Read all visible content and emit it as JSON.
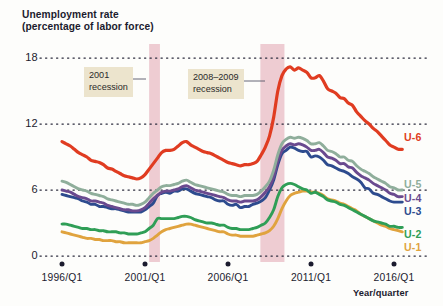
{
  "chart_data": {
    "type": "line",
    "title": "Unemployment rate",
    "subtitle": "(percentage of labor force)",
    "xlabel": "Year/quarter",
    "ylabel": "",
    "ylim": [
      0,
      19.2
    ],
    "xlim": [
      1996,
      2016.75
    ],
    "grid": "horizontal-dotted",
    "legend_position": "right-inline",
    "yticks": [
      "0",
      "6",
      "12",
      "18"
    ],
    "ytick_values": [
      0,
      6,
      12,
      18
    ],
    "xticks": [
      "1996/Q1",
      "2001/Q1",
      "2006/Q1",
      "2011/Q1",
      "2016/Q1"
    ],
    "xtick_values": [
      1996,
      2001,
      2006,
      2011,
      2016
    ],
    "annotations": [
      {
        "name": "recession-2001",
        "label_line1": "2001",
        "label_line2": "recession",
        "band_start": 2001.25,
        "band_end": 2001.9
      },
      {
        "name": "recession-2008-2009",
        "label_line1": "2008–2009",
        "label_line2": "recession",
        "band_start": 2007.95,
        "band_end": 2009.4
      }
    ],
    "band_color": "#e7b8c2",
    "series": [
      {
        "name": "U-6",
        "label": "U-6",
        "color": "#e03c21",
        "x": [
          1996.0,
          1996.25,
          1996.5,
          1996.75,
          1997.0,
          1997.25,
          1997.5,
          1997.75,
          1998.0,
          1998.25,
          1998.5,
          1998.75,
          1999.0,
          1999.25,
          1999.5,
          1999.75,
          2000.0,
          2000.25,
          2000.5,
          2000.75,
          2001.0,
          2001.25,
          2001.5,
          2001.75,
          2002.0,
          2002.25,
          2002.5,
          2002.75,
          2003.0,
          2003.25,
          2003.5,
          2003.75,
          2004.0,
          2004.25,
          2004.5,
          2004.75,
          2005.0,
          2005.25,
          2005.5,
          2005.75,
          2006.0,
          2006.25,
          2006.5,
          2006.75,
          2007.0,
          2007.25,
          2007.5,
          2007.75,
          2008.0,
          2008.25,
          2008.5,
          2008.75,
          2009.0,
          2009.25,
          2009.5,
          2009.75,
          2010.0,
          2010.25,
          2010.5,
          2010.75,
          2011.0,
          2011.25,
          2011.5,
          2011.75,
          2012.0,
          2012.25,
          2012.5,
          2012.75,
          2013.0,
          2013.25,
          2013.5,
          2013.75,
          2014.0,
          2014.25,
          2014.5,
          2014.75,
          2015.0,
          2015.25,
          2015.5,
          2015.75,
          2016.0,
          2016.25,
          2016.5
        ],
        "values": [
          10.4,
          10.2,
          10.0,
          9.7,
          9.4,
          9.2,
          9.0,
          8.7,
          8.6,
          8.5,
          8.3,
          8.0,
          7.9,
          7.7,
          7.5,
          7.3,
          7.2,
          7.1,
          7.0,
          7.1,
          7.4,
          7.9,
          8.4,
          8.9,
          9.4,
          9.6,
          9.6,
          9.7,
          10.0,
          10.3,
          10.4,
          10.1,
          9.9,
          9.7,
          9.5,
          9.4,
          9.3,
          9.1,
          8.9,
          8.7,
          8.5,
          8.4,
          8.3,
          8.2,
          8.3,
          8.3,
          8.4,
          8.6,
          9.2,
          9.9,
          10.9,
          12.6,
          15.0,
          16.4,
          17.0,
          17.2,
          16.9,
          17.1,
          16.9,
          16.7,
          16.2,
          16.2,
          16.4,
          15.9,
          15.2,
          15.0,
          14.8,
          14.4,
          14.3,
          13.9,
          13.7,
          13.1,
          12.7,
          12.3,
          12.0,
          11.6,
          11.3,
          10.9,
          10.5,
          10.1,
          9.9,
          9.7,
          9.7
        ]
      },
      {
        "name": "U-5",
        "label": "U-5",
        "color": "#8fae9b",
        "x": [
          1996.0,
          1996.25,
          1996.5,
          1996.75,
          1997.0,
          1997.25,
          1997.5,
          1997.75,
          1998.0,
          1998.25,
          1998.5,
          1998.75,
          1999.0,
          1999.25,
          1999.5,
          1999.75,
          2000.0,
          2000.25,
          2000.5,
          2000.75,
          2001.0,
          2001.25,
          2001.5,
          2001.75,
          2002.0,
          2002.25,
          2002.5,
          2002.75,
          2003.0,
          2003.25,
          2003.5,
          2003.75,
          2004.0,
          2004.25,
          2004.5,
          2004.75,
          2005.0,
          2005.25,
          2005.5,
          2005.75,
          2006.0,
          2006.25,
          2006.5,
          2006.75,
          2007.0,
          2007.25,
          2007.5,
          2007.75,
          2008.0,
          2008.25,
          2008.5,
          2008.75,
          2009.0,
          2009.25,
          2009.5,
          2009.75,
          2010.0,
          2010.25,
          2010.5,
          2010.75,
          2011.0,
          2011.25,
          2011.5,
          2011.75,
          2012.0,
          2012.25,
          2012.5,
          2012.75,
          2013.0,
          2013.25,
          2013.5,
          2013.75,
          2014.0,
          2014.25,
          2014.5,
          2014.75,
          2015.0,
          2015.25,
          2015.5,
          2015.75,
          2016.0,
          2016.25,
          2016.5
        ],
        "values": [
          6.8,
          6.7,
          6.5,
          6.3,
          6.1,
          6.0,
          5.9,
          5.7,
          5.6,
          5.5,
          5.4,
          5.2,
          5.1,
          5.0,
          4.9,
          4.8,
          4.7,
          4.7,
          4.6,
          4.7,
          4.9,
          5.3,
          5.7,
          6.0,
          6.3,
          6.4,
          6.4,
          6.5,
          6.6,
          6.8,
          6.9,
          6.7,
          6.5,
          6.4,
          6.3,
          6.2,
          6.1,
          6.0,
          5.9,
          5.8,
          5.6,
          5.5,
          5.5,
          5.4,
          5.5,
          5.5,
          5.5,
          5.6,
          5.9,
          6.3,
          6.8,
          7.8,
          9.2,
          10.2,
          10.6,
          10.8,
          10.7,
          10.8,
          10.7,
          10.5,
          10.2,
          10.2,
          10.3,
          10.0,
          9.6,
          9.5,
          9.3,
          9.0,
          9.0,
          8.7,
          8.6,
          8.2,
          7.9,
          7.7,
          7.5,
          7.2,
          7.0,
          6.8,
          6.6,
          6.3,
          6.2,
          6.0,
          6.0
        ]
      },
      {
        "name": "U-4",
        "label": "U-4",
        "color": "#6a4a8f",
        "x": [
          1996.0,
          1996.25,
          1996.5,
          1996.75,
          1997.0,
          1997.25,
          1997.5,
          1997.75,
          1998.0,
          1998.25,
          1998.5,
          1998.75,
          1999.0,
          1999.25,
          1999.5,
          1999.75,
          2000.0,
          2000.25,
          2000.5,
          2000.75,
          2001.0,
          2001.25,
          2001.5,
          2001.75,
          2002.0,
          2002.25,
          2002.5,
          2002.75,
          2003.0,
          2003.25,
          2003.5,
          2003.75,
          2004.0,
          2004.25,
          2004.5,
          2004.75,
          2005.0,
          2005.25,
          2005.5,
          2005.75,
          2006.0,
          2006.25,
          2006.5,
          2006.75,
          2007.0,
          2007.25,
          2007.5,
          2007.75,
          2008.0,
          2008.25,
          2008.5,
          2008.75,
          2009.0,
          2009.25,
          2009.5,
          2009.75,
          2010.0,
          2010.25,
          2010.5,
          2010.75,
          2011.0,
          2011.25,
          2011.5,
          2011.75,
          2012.0,
          2012.25,
          2012.5,
          2012.75,
          2013.0,
          2013.25,
          2013.5,
          2013.75,
          2014.0,
          2014.25,
          2014.5,
          2014.75,
          2015.0,
          2015.25,
          2015.5,
          2015.75,
          2016.0,
          2016.25,
          2016.5
        ],
        "values": [
          6.0,
          5.9,
          5.8,
          5.6,
          5.4,
          5.3,
          5.2,
          5.0,
          5.0,
          4.9,
          4.8,
          4.6,
          4.5,
          4.4,
          4.3,
          4.2,
          4.2,
          4.1,
          4.1,
          4.2,
          4.4,
          4.8,
          5.2,
          5.5,
          5.8,
          5.9,
          5.9,
          6.0,
          6.1,
          6.3,
          6.4,
          6.2,
          6.0,
          5.9,
          5.8,
          5.7,
          5.6,
          5.5,
          5.4,
          5.3,
          5.1,
          5.0,
          5.0,
          4.9,
          5.0,
          5.0,
          5.0,
          5.1,
          5.4,
          5.8,
          6.3,
          7.2,
          8.6,
          9.6,
          10.0,
          10.2,
          10.1,
          10.2,
          10.1,
          9.9,
          9.6,
          9.6,
          9.7,
          9.4,
          9.0,
          8.9,
          8.7,
          8.4,
          8.4,
          8.1,
          8.0,
          7.6,
          7.3,
          7.1,
          6.9,
          6.6,
          6.4,
          6.2,
          6.0,
          5.7,
          5.6,
          5.4,
          5.4
        ]
      },
      {
        "name": "U-3",
        "label": "U-3",
        "color": "#2d4b8e",
        "x": [
          1996.0,
          1996.25,
          1996.5,
          1996.75,
          1997.0,
          1997.25,
          1997.5,
          1997.75,
          1998.0,
          1998.25,
          1998.5,
          1998.75,
          1999.0,
          1999.25,
          1999.5,
          1999.75,
          2000.0,
          2000.25,
          2000.5,
          2000.75,
          2001.0,
          2001.25,
          2001.5,
          2001.75,
          2002.0,
          2002.25,
          2002.5,
          2002.75,
          2003.0,
          2003.25,
          2003.5,
          2003.75,
          2004.0,
          2004.25,
          2004.5,
          2004.75,
          2005.0,
          2005.25,
          2005.5,
          2005.75,
          2006.0,
          2006.25,
          2006.5,
          2006.75,
          2007.0,
          2007.25,
          2007.5,
          2007.75,
          2008.0,
          2008.25,
          2008.5,
          2008.75,
          2009.0,
          2009.25,
          2009.5,
          2009.75,
          2010.0,
          2010.25,
          2010.5,
          2010.75,
          2011.0,
          2011.25,
          2011.5,
          2011.75,
          2012.0,
          2012.25,
          2012.5,
          2012.75,
          2013.0,
          2013.25,
          2013.5,
          2013.75,
          2014.0,
          2014.25,
          2014.5,
          2014.75,
          2015.0,
          2015.25,
          2015.5,
          2015.75,
          2016.0,
          2016.25,
          2016.5
        ],
        "values": [
          5.6,
          5.5,
          5.4,
          5.3,
          5.2,
          5.0,
          4.9,
          4.7,
          4.7,
          4.5,
          4.5,
          4.4,
          4.3,
          4.3,
          4.2,
          4.1,
          4.0,
          4.0,
          4.0,
          4.0,
          4.2,
          4.5,
          4.8,
          5.5,
          5.7,
          5.8,
          5.7,
          5.9,
          5.9,
          6.1,
          6.1,
          5.9,
          5.7,
          5.6,
          5.5,
          5.4,
          5.3,
          5.1,
          5.0,
          5.0,
          4.7,
          4.6,
          4.7,
          4.4,
          4.5,
          4.5,
          4.7,
          4.8,
          5.0,
          5.3,
          6.0,
          6.9,
          8.3,
          9.3,
          9.6,
          9.9,
          9.8,
          9.6,
          9.5,
          9.5,
          9.0,
          9.1,
          9.0,
          8.7,
          8.3,
          8.2,
          8.0,
          7.8,
          7.7,
          7.5,
          7.2,
          7.0,
          6.7,
          6.2,
          6.1,
          5.7,
          5.6,
          5.4,
          5.2,
          5.0,
          4.9,
          4.9,
          4.9
        ]
      },
      {
        "name": "U-2",
        "label": "U-2",
        "color": "#2f9e56",
        "x": [
          1996.0,
          1996.25,
          1996.5,
          1996.75,
          1997.0,
          1997.25,
          1997.5,
          1997.75,
          1998.0,
          1998.25,
          1998.5,
          1998.75,
          1999.0,
          1999.25,
          1999.5,
          1999.75,
          2000.0,
          2000.25,
          2000.5,
          2000.75,
          2001.0,
          2001.25,
          2001.5,
          2001.75,
          2002.0,
          2002.25,
          2002.5,
          2002.75,
          2003.0,
          2003.25,
          2003.5,
          2003.75,
          2004.0,
          2004.25,
          2004.5,
          2004.75,
          2005.0,
          2005.25,
          2005.5,
          2005.75,
          2006.0,
          2006.25,
          2006.5,
          2006.75,
          2007.0,
          2007.25,
          2007.5,
          2007.75,
          2008.0,
          2008.25,
          2008.5,
          2008.75,
          2009.0,
          2009.25,
          2009.5,
          2009.75,
          2010.0,
          2010.25,
          2010.5,
          2010.75,
          2011.0,
          2011.25,
          2011.5,
          2011.75,
          2012.0,
          2012.25,
          2012.5,
          2012.75,
          2013.0,
          2013.25,
          2013.5,
          2013.75,
          2014.0,
          2014.25,
          2014.5,
          2014.75,
          2015.0,
          2015.25,
          2015.5,
          2015.75,
          2016.0,
          2016.25,
          2016.5
        ],
        "values": [
          2.9,
          2.9,
          2.8,
          2.7,
          2.6,
          2.5,
          2.5,
          2.4,
          2.4,
          2.3,
          2.3,
          2.2,
          2.2,
          2.2,
          2.1,
          2.1,
          2.0,
          2.0,
          2.0,
          2.1,
          2.2,
          2.5,
          2.8,
          3.4,
          3.4,
          3.4,
          3.4,
          3.4,
          3.5,
          3.6,
          3.6,
          3.5,
          3.3,
          3.2,
          3.1,
          3.0,
          3.0,
          2.9,
          2.8,
          2.8,
          2.6,
          2.5,
          2.5,
          2.4,
          2.4,
          2.4,
          2.5,
          2.6,
          2.8,
          3.0,
          3.5,
          4.2,
          5.4,
          6.2,
          6.5,
          6.6,
          6.5,
          6.3,
          6.1,
          6.0,
          5.7,
          5.8,
          5.6,
          5.4,
          5.1,
          5.0,
          4.9,
          4.7,
          4.6,
          4.4,
          4.2,
          4.0,
          3.8,
          3.6,
          3.4,
          3.2,
          3.1,
          3.0,
          2.9,
          2.7,
          2.7,
          2.6,
          2.6
        ]
      },
      {
        "name": "U-1",
        "label": "U-1",
        "color": "#e0a33e",
        "x": [
          1996.0,
          1996.25,
          1996.5,
          1996.75,
          1997.0,
          1997.25,
          1997.5,
          1997.75,
          1998.0,
          1998.25,
          1998.5,
          1998.75,
          1999.0,
          1999.25,
          1999.5,
          1999.75,
          2000.0,
          2000.25,
          2000.5,
          2000.75,
          2001.0,
          2001.25,
          2001.5,
          2001.75,
          2002.0,
          2002.25,
          2002.5,
          2002.75,
          2003.0,
          2003.25,
          2003.5,
          2003.75,
          2004.0,
          2004.25,
          2004.5,
          2004.75,
          2005.0,
          2005.25,
          2005.5,
          2005.75,
          2006.0,
          2006.25,
          2006.5,
          2006.75,
          2007.0,
          2007.25,
          2007.5,
          2007.75,
          2008.0,
          2008.25,
          2008.5,
          2008.75,
          2009.0,
          2009.25,
          2009.5,
          2009.75,
          2010.0,
          2010.25,
          2010.5,
          2010.75,
          2011.0,
          2011.25,
          2011.5,
          2011.75,
          2012.0,
          2012.25,
          2012.5,
          2012.75,
          2013.0,
          2013.25,
          2013.5,
          2013.75,
          2014.0,
          2014.25,
          2014.5,
          2014.75,
          2015.0,
          2015.25,
          2015.5,
          2015.75,
          2016.0,
          2016.25,
          2016.5
        ],
        "values": [
          2.2,
          2.1,
          2.0,
          1.9,
          1.8,
          1.7,
          1.6,
          1.6,
          1.5,
          1.5,
          1.4,
          1.4,
          1.4,
          1.3,
          1.3,
          1.2,
          1.2,
          1.2,
          1.2,
          1.2,
          1.3,
          1.4,
          1.6,
          1.9,
          2.2,
          2.4,
          2.5,
          2.6,
          2.7,
          2.8,
          2.9,
          2.9,
          2.8,
          2.7,
          2.6,
          2.5,
          2.4,
          2.3,
          2.2,
          2.2,
          2.0,
          1.9,
          1.9,
          1.8,
          1.8,
          1.8,
          1.8,
          1.9,
          2.0,
          2.1,
          2.3,
          2.7,
          3.4,
          4.3,
          5.0,
          5.5,
          5.7,
          5.8,
          5.9,
          5.9,
          5.8,
          5.8,
          5.7,
          5.5,
          5.2,
          5.1,
          5.0,
          4.8,
          4.7,
          4.5,
          4.3,
          4.1,
          3.8,
          3.6,
          3.4,
          3.2,
          3.0,
          2.8,
          2.7,
          2.5,
          2.4,
          2.3,
          2.2
        ]
      }
    ]
  }
}
